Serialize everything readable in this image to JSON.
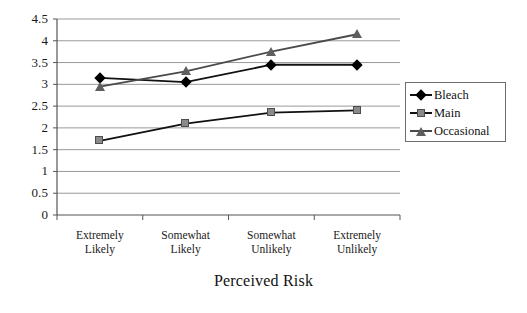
{
  "chart_data": {
    "type": "line",
    "title": "",
    "xlabel": "Perceived Risk",
    "ylabel": "",
    "categories": [
      "Extremely\nLikely",
      "Somewhat\nLikely",
      "Somewhat\nUnlikely",
      "Extremely\nUnlikely"
    ],
    "ylim": [
      0,
      4.5
    ],
    "ytick_labels": [
      "4.5",
      "4",
      "3.5",
      "3",
      "2.5",
      "2",
      "1.5",
      "1",
      "0.5",
      "0"
    ],
    "ytick_values": [
      4.5,
      4,
      3.5,
      3,
      2.5,
      2,
      1.5,
      1,
      0.5,
      0
    ],
    "grid": true,
    "legend_position": "right",
    "series": [
      {
        "name": "Bleach",
        "marker": "diamond",
        "color": "#000000",
        "line_color": "#111111",
        "values": [
          3.15,
          3.05,
          3.45,
          3.45
        ]
      },
      {
        "name": "Main",
        "marker": "square",
        "color": "#8a8a8a",
        "line_color": "#111111",
        "values": [
          1.7,
          2.1,
          2.35,
          2.4
        ]
      },
      {
        "name": "Occasional",
        "marker": "triangle",
        "color": "#5e5e5e",
        "line_color": "#4a4a4a",
        "values": [
          2.95,
          3.3,
          3.75,
          4.15
        ]
      }
    ]
  },
  "legend": {
    "entries": [
      {
        "label": "Bleach"
      },
      {
        "label": "Main"
      },
      {
        "label": "Occasional"
      }
    ]
  },
  "axes": {
    "x_title": "Perceived Risk"
  }
}
